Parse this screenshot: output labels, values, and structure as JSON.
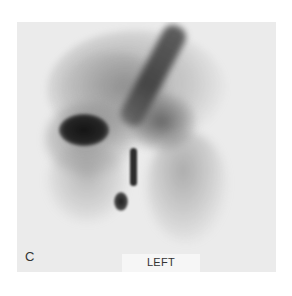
{
  "figure": {
    "panel_label": "C",
    "orientation_label": "LEFT",
    "image_type": "grayscale nuclear scintigraphy scan",
    "colors": {
      "page_background": "#ffffff",
      "scan_background": "#ebebeb",
      "label_box": "#f6f6f6",
      "text": "#333333"
    }
  }
}
